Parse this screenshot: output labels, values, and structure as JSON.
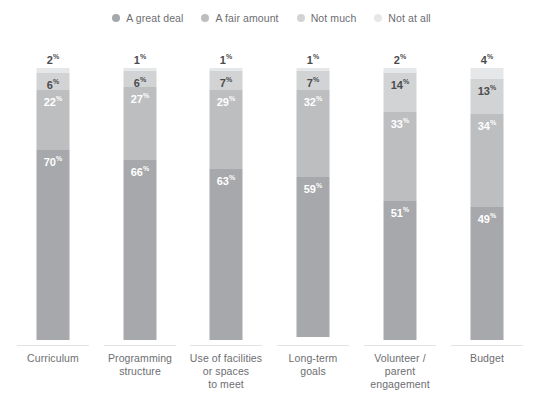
{
  "legend": {
    "position": "top-center",
    "items": [
      {
        "label": "A great deal",
        "color": "#a6a8ab"
      },
      {
        "label": "A fair amount",
        "color": "#bcbec0"
      },
      {
        "label": "Not much",
        "color": "#d1d3d4"
      },
      {
        "label": "Not at all",
        "color": "#e6e7e8"
      }
    ]
  },
  "chart_data": {
    "type": "bar",
    "subtype": "stacked-vertical",
    "title": "",
    "xlabel": "",
    "ylabel": "",
    "ylim": [
      0,
      100
    ],
    "grid": false,
    "value_suffix": "%",
    "categories": [
      "Curriculum",
      "Programming structure",
      "Use of facilities or spaces to meet",
      "Long-term goals",
      "Volunteer / parent engagement",
      "Budget"
    ],
    "category_lines": [
      [
        "Curriculum"
      ],
      [
        "Programming",
        "structure"
      ],
      [
        "Use of facilities",
        "or spaces",
        "to meet"
      ],
      [
        "Long-term",
        "goals"
      ],
      [
        "Volunteer /",
        "parent",
        "engagement"
      ],
      [
        "Budget"
      ]
    ],
    "series": [
      {
        "name": "Not at all",
        "color": "#e6e7e8",
        "values": [
          2,
          1,
          1,
          1,
          2,
          4
        ]
      },
      {
        "name": "Not much",
        "color": "#d1d3d4",
        "values": [
          6,
          6,
          7,
          7,
          14,
          13
        ]
      },
      {
        "name": "A fair amount",
        "color": "#bcbec0",
        "values": [
          22,
          27,
          29,
          32,
          33,
          34
        ]
      },
      {
        "name": "A great deal",
        "color": "#a6a8ab",
        "values": [
          70,
          66,
          63,
          59,
          51,
          49
        ]
      }
    ],
    "stack_order_top_to_bottom": [
      "Not at all",
      "Not much",
      "A fair amount",
      "A great deal"
    ],
    "bars": [
      {
        "category": "Curriculum",
        "segments": [
          {
            "name": "Not at all",
            "value": 2,
            "label": "2",
            "label_placement": "above-bar",
            "label_color": "dark"
          },
          {
            "name": "Not much",
            "value": 6,
            "label": "6",
            "label_placement": "inside",
            "label_color": "dark"
          },
          {
            "name": "A fair amount",
            "value": 22,
            "label": "22",
            "label_placement": "inside",
            "label_color": "light"
          },
          {
            "name": "A great deal",
            "value": 70,
            "label": "70",
            "label_placement": "inside",
            "label_color": "light"
          }
        ]
      },
      {
        "category": "Programming structure",
        "segments": [
          {
            "name": "Not at all",
            "value": 1,
            "label": "1",
            "label_placement": "above-bar",
            "label_color": "dark"
          },
          {
            "name": "Not much",
            "value": 6,
            "label": "6",
            "label_placement": "inside",
            "label_color": "dark"
          },
          {
            "name": "A fair amount",
            "value": 27,
            "label": "27",
            "label_placement": "inside",
            "label_color": "light"
          },
          {
            "name": "A great deal",
            "value": 66,
            "label": "66",
            "label_placement": "inside",
            "label_color": "light"
          }
        ]
      },
      {
        "category": "Use of facilities or spaces to meet",
        "segments": [
          {
            "name": "Not at all",
            "value": 1,
            "label": "1",
            "label_placement": "above-bar",
            "label_color": "dark"
          },
          {
            "name": "Not much",
            "value": 7,
            "label": "7",
            "label_placement": "inside",
            "label_color": "dark"
          },
          {
            "name": "A fair amount",
            "value": 29,
            "label": "29",
            "label_placement": "inside",
            "label_color": "light"
          },
          {
            "name": "A great deal",
            "value": 63,
            "label": "63",
            "label_placement": "inside",
            "label_color": "light"
          }
        ]
      },
      {
        "category": "Long-term goals",
        "segments": [
          {
            "name": "Not at all",
            "value": 1,
            "label": "1",
            "label_placement": "above-bar",
            "label_color": "dark"
          },
          {
            "name": "Not much",
            "value": 7,
            "label": "7",
            "label_placement": "inside",
            "label_color": "dark"
          },
          {
            "name": "A fair amount",
            "value": 32,
            "label": "32",
            "label_placement": "inside",
            "label_color": "light"
          },
          {
            "name": "A great deal",
            "value": 59,
            "label": "59",
            "label_placement": "inside",
            "label_color": "light"
          }
        ]
      },
      {
        "category": "Volunteer / parent engagement",
        "segments": [
          {
            "name": "Not at all",
            "value": 2,
            "label": "2",
            "label_placement": "above-bar",
            "label_color": "dark"
          },
          {
            "name": "Not much",
            "value": 14,
            "label": "14",
            "label_placement": "inside",
            "label_color": "dark"
          },
          {
            "name": "A fair amount",
            "value": 33,
            "label": "33",
            "label_placement": "inside",
            "label_color": "light"
          },
          {
            "name": "A great deal",
            "value": 51,
            "label": "51",
            "label_placement": "inside",
            "label_color": "light"
          }
        ]
      },
      {
        "category": "Budget",
        "segments": [
          {
            "name": "Not at all",
            "value": 4,
            "label": "4",
            "label_placement": "above-bar",
            "label_color": "dark"
          },
          {
            "name": "Not much",
            "value": 13,
            "label": "13",
            "label_placement": "inside",
            "label_color": "dark"
          },
          {
            "name": "A fair amount",
            "value": 34,
            "label": "34",
            "label_placement": "inside",
            "label_color": "light"
          },
          {
            "name": "A great deal",
            "value": 49,
            "label": "49",
            "label_placement": "inside",
            "label_color": "light"
          }
        ]
      }
    ]
  },
  "geometry": {
    "bar_top_y": 68,
    "bar_bottom_y": 340,
    "bar_width": 33,
    "column_centers": [
      53,
      140,
      226,
      313,
      400,
      487
    ],
    "axis_rule_y": 345,
    "category_label_top_y": 352
  }
}
